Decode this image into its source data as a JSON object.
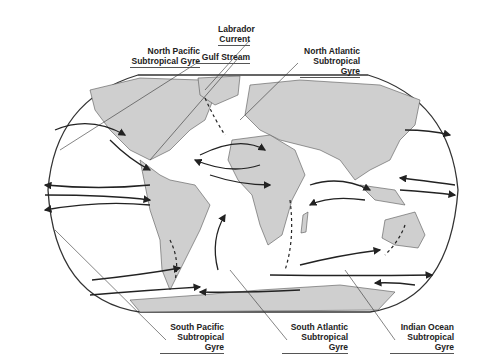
{
  "labels": {
    "labrador": {
      "line1": "Labrador",
      "line2": "Current"
    },
    "north_pacific": {
      "line1": "North Pacific",
      "line2": "Subtropical Gyre"
    },
    "gulf_stream": {
      "line1": "Gulf Stream"
    },
    "north_atlantic": {
      "line1": "North Atlantic",
      "line2": "Subtropical Gyre"
    },
    "south_pacific": {
      "line1": "South Pacific",
      "line2": "Subtropical Gyre"
    },
    "south_atlantic": {
      "line1": "South Atlantic",
      "line2": "Subtropical Gyre"
    },
    "indian_ocean": {
      "line1": "Indian Ocean",
      "line2": "Subtropical Gyre"
    }
  },
  "colors": {
    "land": "#cfcfcf",
    "ocean": "#ffffff",
    "outline": "#333333",
    "arrow": "#222222"
  }
}
